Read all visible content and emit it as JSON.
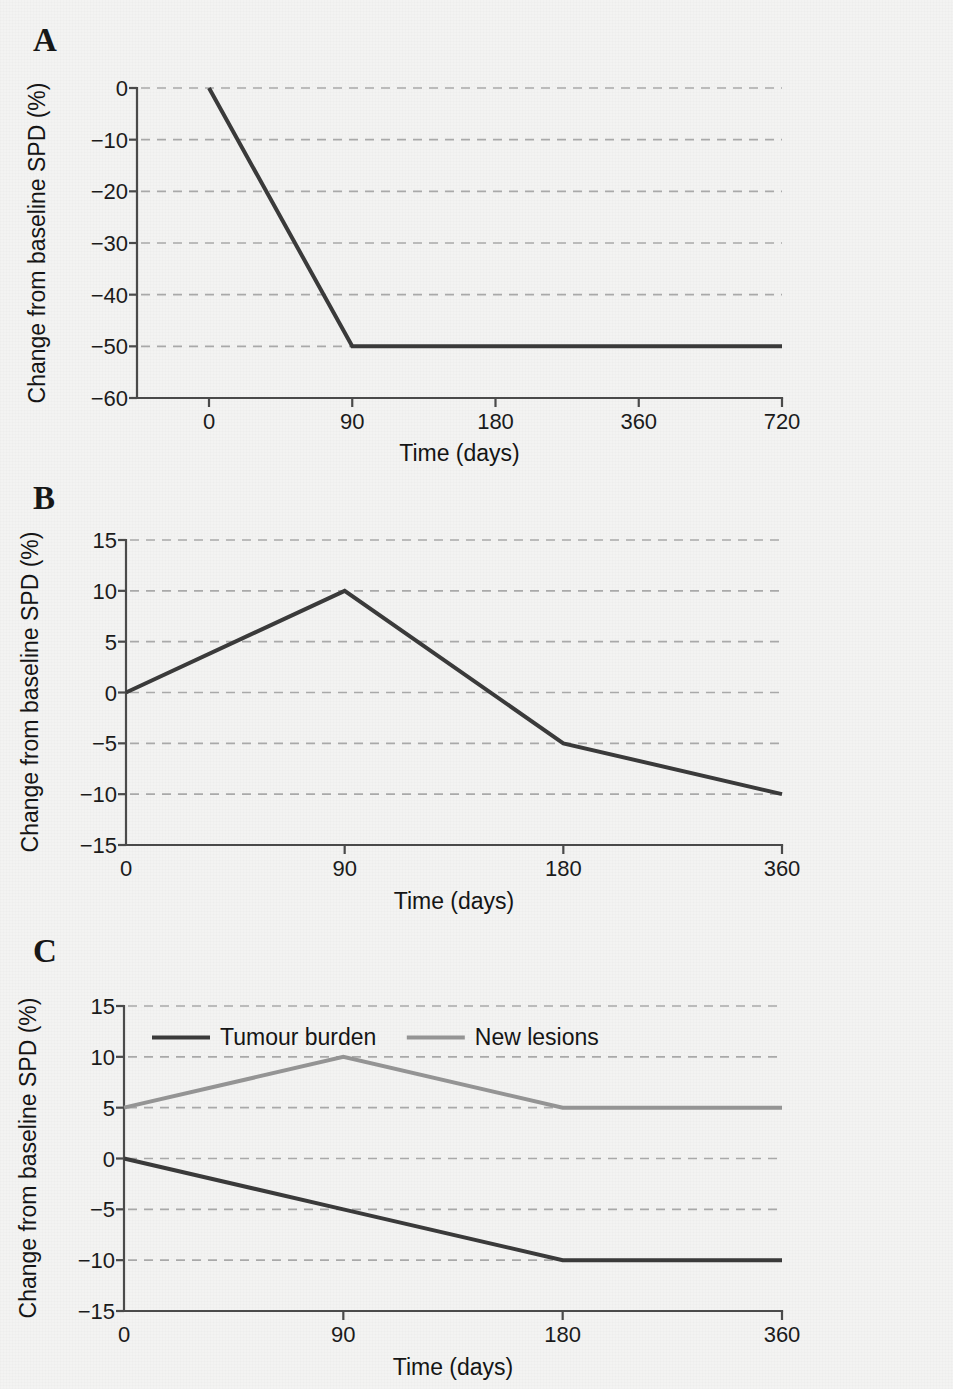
{
  "figure": {
    "background_color": "#f3f3f2",
    "axis_color": "#4a4a4a",
    "grid_color": "#a9a9a9",
    "text_color": "#1b1b1b"
  },
  "panels": [
    {
      "letter": "A",
      "chart_data": {
        "type": "line",
        "title": "",
        "xlabel": "Time (days)",
        "ylabel": "Change from baseline SPD (%)",
        "x_ticks": [
          "0",
          "90",
          "180",
          "360",
          "720"
        ],
        "y_ticks": [
          "0",
          "−10",
          "−20",
          "−30",
          "−40",
          "−50",
          "−60"
        ],
        "ylim": [
          -60,
          0
        ],
        "grid": "horizontal-dashed",
        "legend": "none",
        "series": [
          {
            "name": "Tumour burden",
            "color": "#3a3a3a",
            "width": 4,
            "x": [
              0,
              90,
              180,
              360,
              720
            ],
            "values": [
              0,
              -50,
              -50,
              -50,
              -50
            ]
          }
        ]
      }
    },
    {
      "letter": "B",
      "chart_data": {
        "type": "line",
        "title": "",
        "xlabel": "Time (days)",
        "ylabel": "Change from baseline SPD (%)",
        "x_ticks": [
          "0",
          "90",
          "180",
          "360"
        ],
        "y_ticks": [
          "15",
          "10",
          "5",
          "0",
          "−5",
          "−10",
          "−15"
        ],
        "ylim": [
          -15,
          15
        ],
        "grid": "horizontal-dashed",
        "legend": "none",
        "series": [
          {
            "name": "Tumour burden",
            "color": "#3a3a3a",
            "width": 4,
            "x": [
              0,
              90,
              180,
              360
            ],
            "values": [
              0,
              10,
              -5,
              -10
            ]
          }
        ]
      }
    },
    {
      "letter": "C",
      "chart_data": {
        "type": "line",
        "title": "",
        "xlabel": "Time (days)",
        "ylabel": "Change from baseline SPD (%)",
        "x_ticks": [
          "0",
          "90",
          "180",
          "360"
        ],
        "y_ticks": [
          "15",
          "10",
          "5",
          "0",
          "−5",
          "−10",
          "−15"
        ],
        "ylim": [
          -15,
          15
        ],
        "grid": "horizontal-dashed",
        "legend": "inside-top-left",
        "legend_entries": [
          "Tumour burden",
          "New lesions"
        ],
        "series": [
          {
            "name": "Tumour burden",
            "color": "#3a3a3a",
            "width": 4,
            "x": [
              0,
              90,
              180,
              360
            ],
            "values": [
              0,
              -5,
              -10,
              -10
            ]
          },
          {
            "name": "New lesions",
            "color": "#949494",
            "width": 4,
            "x": [
              0,
              90,
              180,
              360
            ],
            "values": [
              5,
              10,
              5,
              5
            ]
          }
        ]
      }
    }
  ]
}
